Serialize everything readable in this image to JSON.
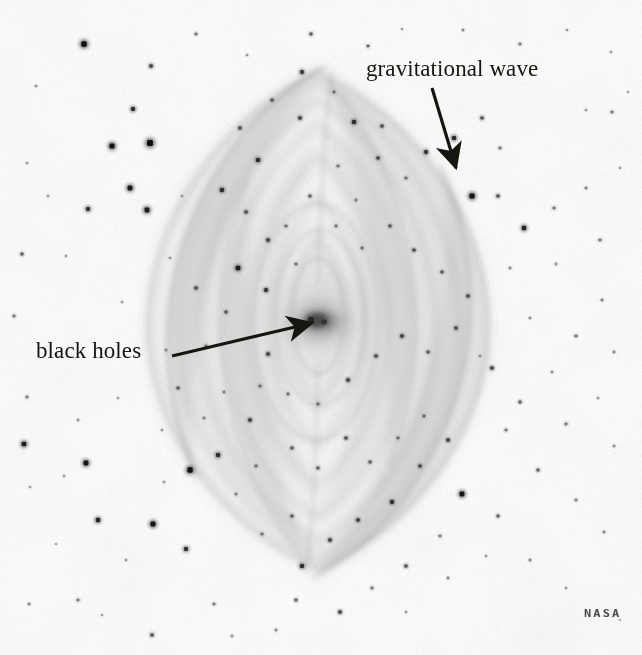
{
  "image": {
    "title": "Gravitational wave illustration",
    "background_color": "#ffffff",
    "ink_color": "#17150f",
    "width": 642,
    "height": 655
  },
  "annotations": [
    {
      "id": "gravitational-wave",
      "label": "gravitational wave",
      "label_x": 366,
      "label_y": 56,
      "arrow_from_x": 432,
      "arrow_from_y": 88,
      "arrow_to_x": 456,
      "arrow_to_y": 170
    },
    {
      "id": "black-holes",
      "label": "black holes",
      "label_x": 36,
      "label_y": 338,
      "arrow_from_x": 172,
      "arrow_from_y": 356,
      "arrow_to_x": 318,
      "arrow_to_y": 322
    }
  ],
  "watermark": {
    "text": "NASA",
    "x": 584,
    "y": 607,
    "color": "#4b4b4b"
  },
  "scene_objects": {
    "center_source": {
      "name": "black holes",
      "cx": 318,
      "cy": 322,
      "rx": 30,
      "ry": 18
    },
    "wave_pattern": {
      "name": "gravitational wave",
      "description": "nested lens-shaped spiral wavefronts",
      "center_x": 318,
      "center_y": 322,
      "shells": [
        {
          "half_width": 42,
          "half_height": 92,
          "opacity": 0.1
        },
        {
          "half_width": 66,
          "half_height": 140,
          "opacity": 0.09
        },
        {
          "half_width": 92,
          "half_height": 184,
          "opacity": 0.085
        },
        {
          "half_width": 118,
          "half_height": 214,
          "opacity": 0.08
        },
        {
          "half_width": 146,
          "half_height": 236,
          "opacity": 0.07
        },
        {
          "half_width": 172,
          "half_height": 250,
          "opacity": 0.06
        }
      ]
    }
  },
  "chart_data": {
    "type": "scatter",
    "xlabel": "",
    "ylabel": "",
    "xlim": [
      0,
      642
    ],
    "ylim": [
      0,
      655
    ],
    "grid": false,
    "legend": null,
    "annotations": [
      "gravitational wave",
      "black holes",
      "NASA"
    ],
    "series": [
      {
        "name": "stars",
        "note": "x, y, radius(px), darkness(0-1)",
        "points": [
          [
            84,
            44,
            4.0,
            0.92
          ],
          [
            151,
            66,
            2.6,
            0.6
          ],
          [
            36,
            86,
            1.5,
            0.35
          ],
          [
            196,
            34,
            2.0,
            0.45
          ],
          [
            247,
            55,
            1.6,
            0.3
          ],
          [
            311,
            34,
            2.2,
            0.5
          ],
          [
            368,
            46,
            2.0,
            0.45
          ],
          [
            402,
            29,
            1.4,
            0.3
          ],
          [
            463,
            30,
            1.7,
            0.35
          ],
          [
            520,
            44,
            1.9,
            0.4
          ],
          [
            567,
            30,
            1.5,
            0.3
          ],
          [
            611,
            52,
            1.6,
            0.3
          ],
          [
            612,
            112,
            2.0,
            0.4
          ],
          [
            628,
            92,
            1.4,
            0.28
          ],
          [
            586,
            110,
            1.6,
            0.3
          ],
          [
            133,
            109,
            2.9,
            0.75
          ],
          [
            112,
            146,
            3.8,
            0.9
          ],
          [
            150,
            143,
            4.4,
            0.95
          ],
          [
            130,
            188,
            3.6,
            0.85
          ],
          [
            147,
            210,
            3.6,
            0.85
          ],
          [
            88,
            209,
            3.0,
            0.7
          ],
          [
            48,
            196,
            1.6,
            0.3
          ],
          [
            27,
            163,
            1.6,
            0.3
          ],
          [
            66,
            256,
            1.6,
            0.3
          ],
          [
            22,
            254,
            2.2,
            0.5
          ],
          [
            14,
            316,
            2.0,
            0.42
          ],
          [
            56,
            354,
            1.5,
            0.28
          ],
          [
            27,
            397,
            2.0,
            0.4
          ],
          [
            24,
            444,
            3.4,
            0.82
          ],
          [
            78,
            420,
            1.7,
            0.32
          ],
          [
            30,
            487,
            1.5,
            0.28
          ],
          [
            86,
            463,
            3.6,
            0.88
          ],
          [
            64,
            476,
            1.6,
            0.3
          ],
          [
            98,
            520,
            3.2,
            0.78
          ],
          [
            29,
            604,
            1.8,
            0.36
          ],
          [
            78,
            600,
            2.0,
            0.4
          ],
          [
            126,
            560,
            1.6,
            0.3
          ],
          [
            102,
            615,
            1.4,
            0.28
          ],
          [
            152,
            635,
            2.4,
            0.55
          ],
          [
            153,
            524,
            3.7,
            0.9
          ],
          [
            186,
            549,
            3.0,
            0.72
          ],
          [
            214,
            604,
            1.9,
            0.4
          ],
          [
            232,
            636,
            1.7,
            0.32
          ],
          [
            190,
            470,
            3.9,
            0.92
          ],
          [
            218,
            455,
            3.0,
            0.72
          ],
          [
            250,
            420,
            2.6,
            0.6
          ],
          [
            236,
            494,
            1.8,
            0.36
          ],
          [
            204,
            418,
            1.8,
            0.34
          ],
          [
            162,
            430,
            1.6,
            0.3
          ],
          [
            178,
            388,
            2.2,
            0.48
          ],
          [
            206,
            346,
            2.0,
            0.42
          ],
          [
            226,
            312,
            2.2,
            0.5
          ],
          [
            196,
            288,
            2.4,
            0.55
          ],
          [
            238,
            268,
            3.4,
            0.82
          ],
          [
            266,
            290,
            2.8,
            0.68
          ],
          [
            268,
            240,
            2.6,
            0.6
          ],
          [
            246,
            212,
            2.4,
            0.55
          ],
          [
            222,
            190,
            3.0,
            0.72
          ],
          [
            258,
            160,
            3.0,
            0.72
          ],
          [
            240,
            128,
            2.4,
            0.55
          ],
          [
            272,
            100,
            2.2,
            0.48
          ],
          [
            300,
            118,
            2.6,
            0.6
          ],
          [
            302,
            72,
            2.8,
            0.66
          ],
          [
            334,
            92,
            2.0,
            0.4
          ],
          [
            354,
            122,
            3.0,
            0.72
          ],
          [
            382,
            126,
            2.4,
            0.55
          ],
          [
            378,
            158,
            2.4,
            0.55
          ],
          [
            406,
            178,
            2.0,
            0.42
          ],
          [
            426,
            152,
            2.8,
            0.68
          ],
          [
            454,
            138,
            3.1,
            0.75
          ],
          [
            482,
            118,
            2.4,
            0.55
          ],
          [
            500,
            148,
            2.0,
            0.42
          ],
          [
            472,
            196,
            3.8,
            0.9
          ],
          [
            498,
            196,
            2.4,
            0.55
          ],
          [
            524,
            228,
            3.2,
            0.78
          ],
          [
            554,
            208,
            2.0,
            0.42
          ],
          [
            586,
            188,
            1.8,
            0.36
          ],
          [
            600,
            240,
            2.0,
            0.42
          ],
          [
            556,
            264,
            1.7,
            0.32
          ],
          [
            602,
            300,
            1.8,
            0.36
          ],
          [
            576,
            336,
            2.0,
            0.42
          ],
          [
            614,
            352,
            1.8,
            0.34
          ],
          [
            552,
            372,
            1.7,
            0.32
          ],
          [
            598,
            398,
            1.6,
            0.3
          ],
          [
            566,
            424,
            2.0,
            0.42
          ],
          [
            520,
            402,
            2.2,
            0.48
          ],
          [
            492,
            368,
            2.6,
            0.6
          ],
          [
            506,
            430,
            2.0,
            0.42
          ],
          [
            538,
            470,
            2.2,
            0.48
          ],
          [
            462,
            494,
            3.6,
            0.88
          ],
          [
            498,
            516,
            2.2,
            0.48
          ],
          [
            576,
            500,
            1.9,
            0.38
          ],
          [
            604,
            532,
            1.8,
            0.34
          ],
          [
            614,
            446,
            1.7,
            0.32
          ],
          [
            530,
            560,
            1.8,
            0.34
          ],
          [
            566,
            588,
            1.6,
            0.3
          ],
          [
            486,
            556,
            1.6,
            0.3
          ],
          [
            440,
            536,
            2.0,
            0.4
          ],
          [
            448,
            578,
            1.8,
            0.34
          ],
          [
            406,
            566,
            2.4,
            0.55
          ],
          [
            372,
            588,
            2.0,
            0.42
          ],
          [
            340,
            612,
            2.6,
            0.6
          ],
          [
            296,
            600,
            2.2,
            0.48
          ],
          [
            302,
            566,
            3.0,
            0.72
          ],
          [
            276,
            630,
            1.8,
            0.34
          ],
          [
            330,
            540,
            2.6,
            0.6
          ],
          [
            358,
            520,
            2.6,
            0.6
          ],
          [
            392,
            502,
            2.8,
            0.68
          ],
          [
            420,
            466,
            2.4,
            0.55
          ],
          [
            448,
            440,
            2.6,
            0.6
          ],
          [
            424,
            416,
            2.0,
            0.42
          ],
          [
            398,
            438,
            2.0,
            0.42
          ],
          [
            370,
            462,
            2.2,
            0.48
          ],
          [
            346,
            438,
            2.4,
            0.55
          ],
          [
            318,
            468,
            2.2,
            0.48
          ],
          [
            292,
            448,
            2.2,
            0.48
          ],
          [
            288,
            394,
            2.0,
            0.42
          ],
          [
            318,
            404,
            2.0,
            0.42
          ],
          [
            348,
            380,
            2.6,
            0.6
          ],
          [
            376,
            356,
            2.4,
            0.55
          ],
          [
            402,
            336,
            2.6,
            0.6
          ],
          [
            428,
            352,
            2.2,
            0.48
          ],
          [
            456,
            328,
            2.4,
            0.55
          ],
          [
            468,
            296,
            2.4,
            0.55
          ],
          [
            442,
            272,
            2.2,
            0.48
          ],
          [
            414,
            250,
            2.4,
            0.55
          ],
          [
            390,
            226,
            2.2,
            0.48
          ],
          [
            362,
            248,
            2.0,
            0.42
          ],
          [
            336,
            226,
            2.0,
            0.42
          ],
          [
            310,
            196,
            2.2,
            0.48
          ],
          [
            286,
            226,
            2.0,
            0.42
          ],
          [
            296,
            264,
            2.0,
            0.42
          ],
          [
            268,
            354,
            2.6,
            0.6
          ],
          [
            260,
            386,
            2.0,
            0.42
          ],
          [
            292,
            516,
            2.2,
            0.48
          ],
          [
            256,
            466,
            2.0,
            0.42
          ],
          [
            224,
            392,
            1.8,
            0.34
          ],
          [
            166,
            350,
            1.7,
            0.32
          ],
          [
            122,
            302,
            1.6,
            0.3
          ],
          [
            170,
            258,
            1.6,
            0.3
          ],
          [
            182,
            196,
            1.5,
            0.28
          ],
          [
            338,
            166,
            2.0,
            0.4
          ],
          [
            356,
            200,
            1.8,
            0.34
          ],
          [
            510,
            268,
            1.8,
            0.34
          ],
          [
            530,
            318,
            1.7,
            0.32
          ],
          [
            480,
            356,
            1.6,
            0.3
          ],
          [
            262,
            534,
            2.0,
            0.4
          ],
          [
            118,
            398,
            1.5,
            0.28
          ],
          [
            56,
            544,
            1.4,
            0.26
          ],
          [
            620,
            620,
            1.3,
            0.24
          ],
          [
            620,
            168,
            1.5,
            0.28
          ],
          [
            406,
            612,
            1.6,
            0.3
          ],
          [
            164,
            482,
            1.6,
            0.3
          ]
        ]
      }
    ]
  }
}
